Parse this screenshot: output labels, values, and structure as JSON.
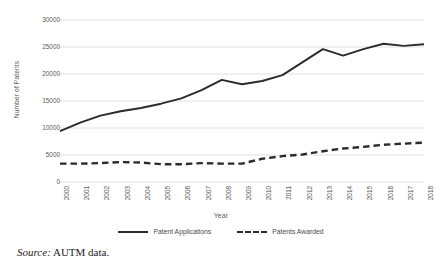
{
  "chart_data": {
    "type": "line",
    "title": "",
    "xlabel": "Year",
    "ylabel": "Number of Patents",
    "categories": [
      "2000",
      "2001",
      "2002",
      "2003",
      "2004",
      "2005",
      "2006",
      "2007",
      "2008",
      "2009",
      "2010",
      "2011",
      "2012",
      "2013",
      "2014",
      "2015",
      "2016",
      "2017",
      "2018"
    ],
    "series": [
      {
        "name": "Patent Applications",
        "style": "solid",
        "color": "#2b2b2b",
        "values": [
          9400,
          11000,
          12300,
          13100,
          13700,
          14500,
          15500,
          17000,
          18900,
          18100,
          18700,
          19800,
          22200,
          24600,
          23400,
          24600,
          25600,
          25200,
          25500
        ]
      },
      {
        "name": "Patents Awarded",
        "style": "dashed",
        "color": "#2b2b2b",
        "values": [
          3400,
          3400,
          3500,
          3700,
          3600,
          3300,
          3300,
          3500,
          3400,
          3400,
          4300,
          4800,
          5100,
          5700,
          6200,
          6500,
          6900,
          7100,
          7300
        ]
      }
    ],
    "ylim": [
      0,
      30000
    ],
    "yticks": [
      30000,
      25000,
      20000,
      15000,
      10000,
      5000,
      0
    ],
    "ytick_labels": [
      "30000",
      "25000",
      "20000",
      "15000",
      "10000",
      "5000",
      "0"
    ],
    "grid": "horizontal",
    "legend_position": "bottom"
  },
  "caption": {
    "source_label": "Source:",
    "source_text": "AUTM data."
  }
}
